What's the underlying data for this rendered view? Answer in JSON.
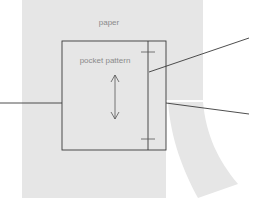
{
  "diagram": {
    "labels": {
      "paper": "paper",
      "pocket": "pocket pattern"
    },
    "colors": {
      "background": "#ffffff",
      "paper": "#e6e6e6",
      "strip": "#e6e6e6",
      "line": "#3a3a3a",
      "label": "#8a8a8a"
    },
    "elements": [
      {
        "id": "paper-sheet",
        "kind": "rectangle"
      },
      {
        "id": "paper-strip",
        "kind": "curved-band"
      },
      {
        "id": "pocket-pattern-outline",
        "kind": "rectangle"
      },
      {
        "id": "fold-line",
        "kind": "vertical-line",
        "marks": 2
      },
      {
        "id": "grainline-arrow",
        "kind": "double-arrow"
      },
      {
        "id": "leader-left",
        "kind": "line"
      },
      {
        "id": "leader-top-right",
        "kind": "line"
      },
      {
        "id": "leader-lower-right",
        "kind": "line"
      }
    ]
  }
}
